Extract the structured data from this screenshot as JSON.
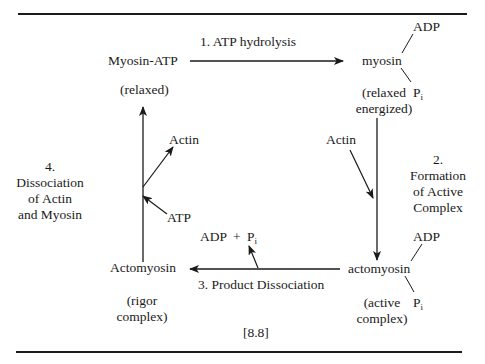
{
  "figure": {
    "label": "[8.8]",
    "states": {
      "myosin_atp": {
        "name": "Myosin-ATP",
        "state": "(relaxed)"
      },
      "myosin": {
        "name": "myosin",
        "state_line1": "(relaxed",
        "state_line2": "energized)",
        "bound_top": "ADP",
        "bound_bottom": "P",
        "bound_bottom_sub": "i"
      },
      "actomyosin_active": {
        "name": "actomyosin",
        "state_line1": "(active",
        "state_line2": "complex)",
        "bound_top": "ADP",
        "bound_bottom": "P",
        "bound_bottom_sub": "i"
      },
      "actomyosin_rigor": {
        "name": "Actomyosin",
        "state_line1": "(rigor",
        "state_line2": "complex)"
      }
    },
    "steps": {
      "step1": {
        "label": "1. ATP hydrolysis"
      },
      "step2": {
        "num": "2.",
        "line1": "Formation",
        "line2": "of Active",
        "line3": "Complex",
        "input": "Actin"
      },
      "step3": {
        "label": "3. Product Dissociation",
        "output_a": "ADP",
        "plus": "+",
        "output_b": "P",
        "output_b_sub": "i"
      },
      "step4": {
        "num": "4.",
        "line1": "Dissociation",
        "line2": "of Actin",
        "line3": "and Myosin",
        "output": "Actin",
        "input": "ATP"
      }
    }
  }
}
